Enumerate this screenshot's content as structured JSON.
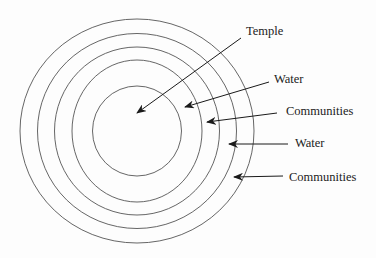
{
  "diagram": {
    "type": "concentric-circles",
    "center": {
      "x": 137,
      "y": 131
    },
    "rings": [
      {
        "name": "ring-outer",
        "rx": 117,
        "ry": 112
      },
      {
        "name": "ring-2",
        "rx": 99.5,
        "ry": 97.5
      },
      {
        "name": "ring-3",
        "rx": 82.5,
        "ry": 84
      },
      {
        "name": "ring-4",
        "rx": 65,
        "ry": 71
      },
      {
        "name": "ring-inner",
        "rx": 44.5,
        "ry": 45
      }
    ],
    "labels": [
      {
        "id": "temple",
        "text": "Temple",
        "x": 246,
        "y": 31,
        "arrow": {
          "x1": 241,
          "y1": 38,
          "x2": 137,
          "y2": 113
        }
      },
      {
        "id": "water-1",
        "text": "Water",
        "x": 274,
        "y": 79,
        "arrow": {
          "x1": 269,
          "y1": 82,
          "x2": 185,
          "y2": 107
        }
      },
      {
        "id": "communities-1",
        "text": "Communities",
        "x": 286,
        "y": 111,
        "arrow": {
          "x1": 277,
          "y1": 113,
          "x2": 207,
          "y2": 122
        }
      },
      {
        "id": "water-2",
        "text": "Water",
        "x": 295,
        "y": 143,
        "arrow": {
          "x1": 288,
          "y1": 144,
          "x2": 229,
          "y2": 144
        }
      },
      {
        "id": "communities-2",
        "text": "Communities",
        "x": 289,
        "y": 177,
        "arrow": {
          "x1": 283,
          "y1": 176,
          "x2": 234,
          "y2": 177
        }
      }
    ],
    "colors": {
      "ring": "#555555",
      "arrow": "#1a1a1a",
      "text": "#222222",
      "background": "#fdfdfd"
    }
  }
}
